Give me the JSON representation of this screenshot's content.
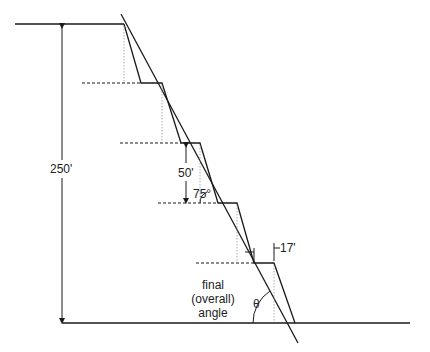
{
  "diagram": {
    "type": "open-pit bench slope cross-section",
    "labels": {
      "total_height": "250'",
      "bench_height": "50'",
      "face_angle": "75°",
      "bench_width": "17'",
      "overall_angle_line1": "final",
      "overall_angle_line2": "(overall)",
      "overall_angle_line3": "angle",
      "theta": "θ"
    },
    "benches": [
      {
        "index": 1,
        "y": 83
      },
      {
        "index": 2,
        "y": 143
      },
      {
        "index": 3,
        "y": 203
      },
      {
        "index": 4,
        "y": 263
      }
    ],
    "colors": {
      "line": "#1a1a1a",
      "construction": "#9a9a9a",
      "background": "#ffffff"
    }
  }
}
